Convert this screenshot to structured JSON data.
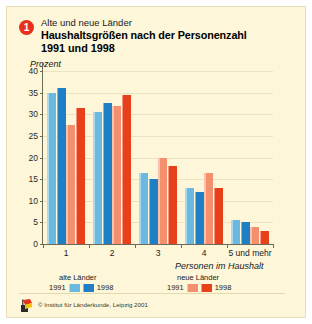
{
  "header": {
    "badge_number": "1",
    "kicker": "Alte und neue Länder",
    "title_line1": "Haushaltsgrößen nach der Personenzahl",
    "title_line2": "1991 und 1998"
  },
  "colors": {
    "background": "#fdf6d8",
    "old_laender_1991": "#6bb8e0",
    "old_laender_1998": "#1e7fc4",
    "new_laender_1991": "#f4906e",
    "new_laender_1998": "#e8401a",
    "badge": "#e8301a",
    "axis": "#6b6b5a",
    "grid": "#ece3c0"
  },
  "legend": {
    "groups": [
      {
        "title": "alte Länder",
        "entries": [
          {
            "year": "1991",
            "color": "#6bb8e0"
          },
          {
            "year": "1998",
            "color": "#1e7fc4"
          }
        ]
      },
      {
        "title": "neue Länder",
        "entries": [
          {
            "year": "1991",
            "color": "#f4906e"
          },
          {
            "year": "1998",
            "color": "#e8401a"
          }
        ]
      }
    ]
  },
  "footer": {
    "copyright": "© Institut für Länderkunde, Leipzig 2001"
  },
  "chart_data": {
    "type": "bar",
    "title": "Haushaltsgrößen nach der Personenzahl 1991 und 1998",
    "subtitle": "Alte und neue Länder",
    "xlabel": "Personen im Haushalt",
    "ylabel": "Prozent",
    "ylim": [
      0,
      40
    ],
    "yticks": [
      0,
      5,
      10,
      15,
      20,
      25,
      30,
      35,
      40
    ],
    "grid": true,
    "legend_position": "bottom",
    "categories": [
      "1",
      "2",
      "3",
      "4",
      "5 und mehr"
    ],
    "series": [
      {
        "name": "alte Länder 1991",
        "color": "#6bb8e0",
        "values": [
          35.0,
          30.5,
          16.5,
          13.0,
          5.5
        ]
      },
      {
        "name": "alte Länder 1998",
        "color": "#1e7fc4",
        "values": [
          36.0,
          32.5,
          15.0,
          12.0,
          5.0
        ]
      },
      {
        "name": "neue Länder 1991",
        "color": "#f4906e",
        "values": [
          27.5,
          32.0,
          20.0,
          16.5,
          4.0
        ]
      },
      {
        "name": "neue Länder 1998",
        "color": "#e8401a",
        "values": [
          31.5,
          34.5,
          18.0,
          13.0,
          3.0
        ]
      }
    ]
  }
}
